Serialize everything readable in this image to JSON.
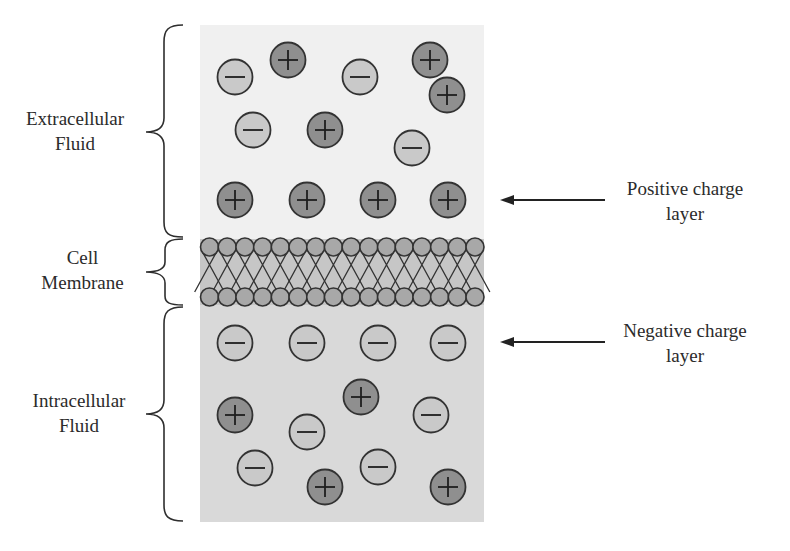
{
  "diagram": {
    "regions": [
      {
        "id": "extracellular",
        "label_line1": "Extracellular",
        "label_line2": "Fluid",
        "fill": "#f0f0f0"
      },
      {
        "id": "membrane",
        "label_line1": "Cell",
        "label_line2": "Membrane",
        "fill": "#c6c6c6"
      },
      {
        "id": "intracellular",
        "label_line1": "Intracellular",
        "label_line2": "Fluid",
        "fill": "#d9d9d9"
      }
    ],
    "annotations": [
      {
        "id": "positive-layer",
        "line1": "Positive charge",
        "line2": "layer"
      },
      {
        "id": "negative-layer",
        "line1": "Negative charge",
        "line2": "layer"
      }
    ],
    "colors": {
      "positive_ion": "#8f8f8f",
      "negative_ion": "#c9c9c9",
      "outline": "#333333",
      "lipid_head": "#a8a8a8"
    },
    "membrane": {
      "heads_per_row": 16
    },
    "ions": {
      "extracellular": [
        {
          "sign": "-",
          "x": 235,
          "y": 77
        },
        {
          "sign": "+",
          "x": 288,
          "y": 60
        },
        {
          "sign": "-",
          "x": 360,
          "y": 77
        },
        {
          "sign": "+",
          "x": 430,
          "y": 60
        },
        {
          "sign": "+",
          "x": 447,
          "y": 95
        },
        {
          "sign": "-",
          "x": 253,
          "y": 130
        },
        {
          "sign": "+",
          "x": 325,
          "y": 130
        },
        {
          "sign": "-",
          "x": 412,
          "y": 148
        },
        {
          "sign": "+",
          "x": 235,
          "y": 200
        },
        {
          "sign": "+",
          "x": 307,
          "y": 200
        },
        {
          "sign": "+",
          "x": 378,
          "y": 200
        },
        {
          "sign": "+",
          "x": 448,
          "y": 200
        }
      ],
      "intracellular": [
        {
          "sign": "-",
          "x": 235,
          "y": 343
        },
        {
          "sign": "-",
          "x": 307,
          "y": 343
        },
        {
          "sign": "-",
          "x": 378,
          "y": 343
        },
        {
          "sign": "-",
          "x": 448,
          "y": 343
        },
        {
          "sign": "+",
          "x": 361,
          "y": 397
        },
        {
          "sign": "+",
          "x": 235,
          "y": 415
        },
        {
          "sign": "-",
          "x": 431,
          "y": 415
        },
        {
          "sign": "-",
          "x": 307,
          "y": 432
        },
        {
          "sign": "-",
          "x": 255,
          "y": 468
        },
        {
          "sign": "-",
          "x": 378,
          "y": 467
        },
        {
          "sign": "+",
          "x": 325,
          "y": 487
        },
        {
          "sign": "+",
          "x": 448,
          "y": 487
        }
      ]
    }
  }
}
